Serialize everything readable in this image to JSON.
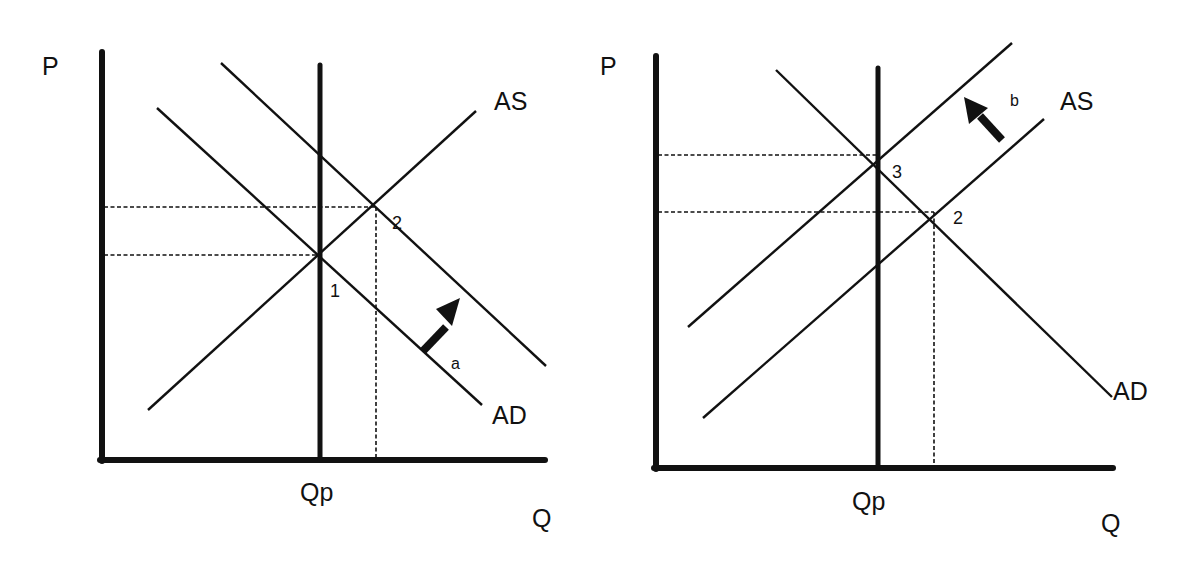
{
  "panels": [
    {
      "id": "left",
      "axis_labels": {
        "y": "P",
        "x": "Q",
        "potential_output": "Qp"
      },
      "curve_labels": {
        "supply": "AS",
        "demand": "AD"
      },
      "points": [
        "1",
        "2"
      ],
      "shift": {
        "label": "a",
        "description": "AD shifts right"
      }
    },
    {
      "id": "right",
      "axis_labels": {
        "y": "P",
        "x": "Q",
        "potential_output": "Qp"
      },
      "curve_labels": {
        "supply": "AS",
        "demand": "AD"
      },
      "points": [
        "3",
        "2"
      ],
      "shift": {
        "label": "b",
        "description": "AS shifts left"
      }
    }
  ],
  "colors": {
    "ink": "#111111",
    "background": "#ffffff"
  }
}
